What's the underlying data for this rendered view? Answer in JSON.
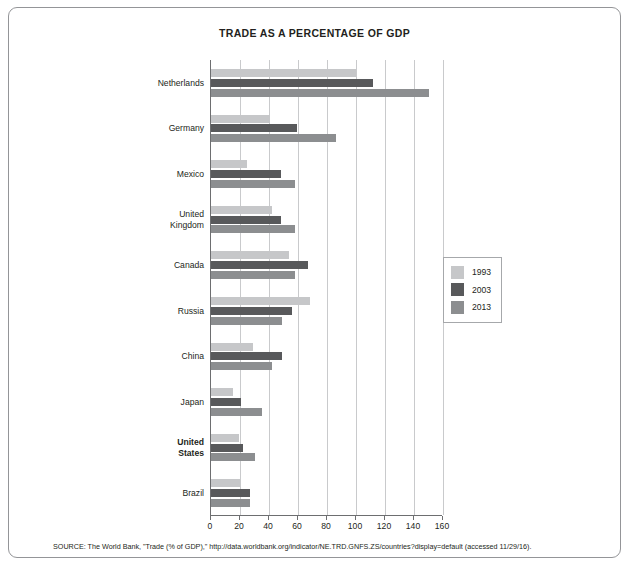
{
  "figure": {
    "title": "TRADE AS A PERCENTAGE OF GDP",
    "source": "SOURCE: The World Bank, \"Trade (% of GDP),\" http://data.worldbank.org/indicator/NE.TRD.GNFS.ZS/countries?display=default (accessed 11/29/16)."
  },
  "legend": {
    "position": "right",
    "entries": [
      {
        "label": "1993",
        "color": "#c6c7c9"
      },
      {
        "label": "2003",
        "color": "#58595b"
      },
      {
        "label": "2013",
        "color": "#8c8e90"
      }
    ]
  },
  "chart_data": {
    "type": "bar",
    "orientation": "horizontal",
    "title": "TRADE AS A PERCENTAGE OF GDP",
    "xlabel": "",
    "ylabel": "",
    "xlim": [
      0,
      160
    ],
    "xticks": [
      0,
      20,
      40,
      60,
      80,
      100,
      120,
      140,
      160
    ],
    "grid": true,
    "highlighted_category": "United States",
    "categories": [
      "Netherlands",
      "Germany",
      "Mexico",
      "United Kingdom",
      "Canada",
      "Russia",
      "China",
      "Japan",
      "United States",
      "Brazil"
    ],
    "series": [
      {
        "name": "1993",
        "color": "#c6c7c9",
        "values": [
          100,
          41,
          25,
          42,
          54,
          68,
          29,
          15,
          19,
          20
        ]
      },
      {
        "name": "2003",
        "color": "#58595b",
        "values": [
          112,
          59,
          48,
          48,
          67,
          56,
          49,
          21,
          22,
          27
        ]
      },
      {
        "name": "2013",
        "color": "#8c8e90",
        "values": [
          150,
          86,
          58,
          58,
          58,
          49,
          42,
          35,
          30,
          27
        ]
      }
    ]
  }
}
